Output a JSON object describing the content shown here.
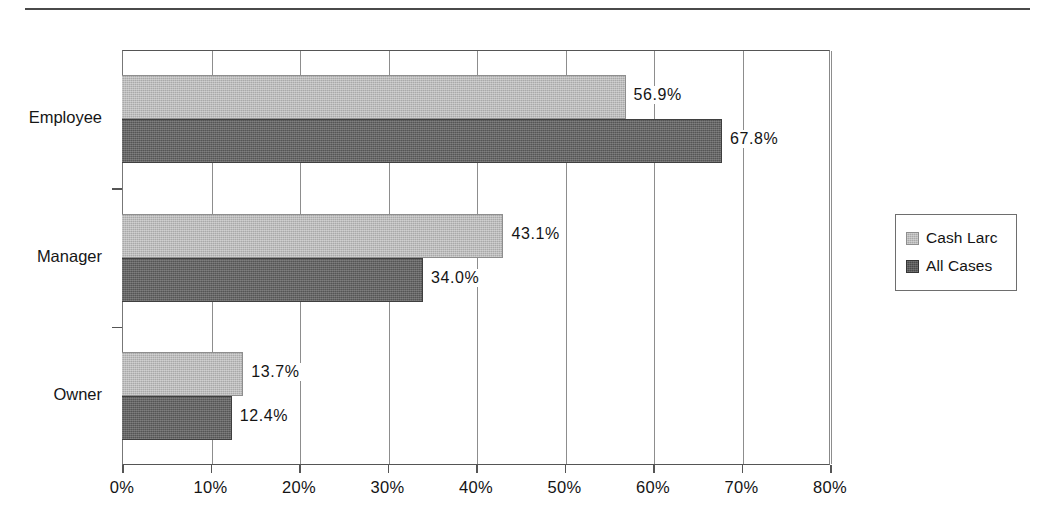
{
  "page": {
    "top_rule": "horizontal-rule"
  },
  "chart_data": {
    "type": "bar",
    "orientation": "horizontal",
    "title": "",
    "subtitle": "",
    "xlabel": "",
    "ylabel": "",
    "categories": [
      "Employee",
      "Manager",
      "Owner"
    ],
    "series": [
      {
        "name": "Cash Larc",
        "values": [
          56.9,
          43.1,
          13.7
        ],
        "color": "#a9a9a9"
      },
      {
        "name": "All Cases",
        "values": [
          67.8,
          34.0,
          12.4
        ],
        "color": "#555555"
      }
    ],
    "value_labels": [
      [
        "56.9%",
        "43.1%",
        "13.7%"
      ],
      [
        "67.8%",
        "34.0%",
        "12.4%"
      ]
    ],
    "xlim": [
      0,
      80
    ],
    "xticks": [
      0,
      10,
      20,
      30,
      40,
      50,
      60,
      70,
      80
    ],
    "xtick_labels": [
      "0%",
      "10%",
      "20%",
      "30%",
      "40%",
      "50%",
      "60%",
      "70%",
      "80%"
    ],
    "grid": true,
    "grid_axis": "x",
    "legend_position": "right",
    "legend_entries": [
      "Cash Larc",
      "All Cases"
    ]
  }
}
